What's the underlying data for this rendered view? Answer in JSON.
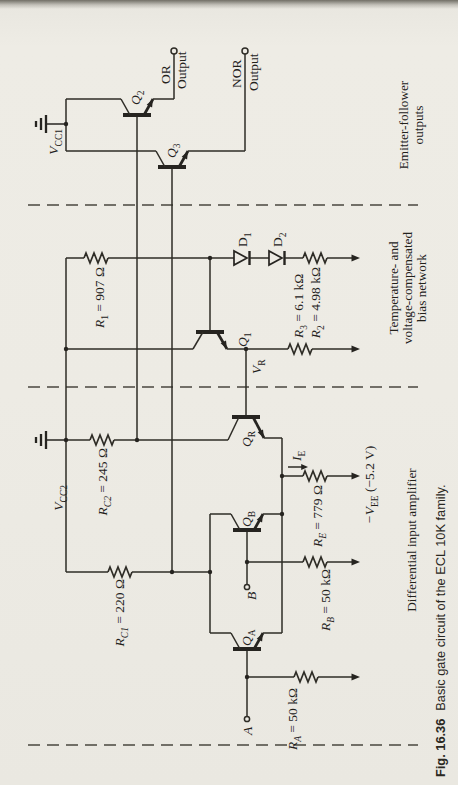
{
  "figure": {
    "caption_fig": "Fig. 16.36",
    "caption_text": "Basic gate circuit of the ECL 10K family.",
    "sections": {
      "emitter_follower": [
        "Emitter-follower",
        "outputs"
      ],
      "bias_network": [
        "Temperature- and",
        "voltage-compensated",
        "bias network"
      ],
      "diff_amp": [
        "Differential input amplifier"
      ]
    },
    "outputs": {
      "or": [
        "OR",
        "Output"
      ],
      "nor": [
        "NOR",
        "Output"
      ]
    },
    "inputs": {
      "a": "A",
      "b": "B"
    },
    "labels": {
      "vcc1": {
        "base": "V",
        "sub": "CC1"
      },
      "vcc2": {
        "base": "V",
        "sub": "CC2"
      },
      "vr": {
        "base": "V",
        "sub": "R"
      },
      "ie": {
        "base": "I",
        "sub": "E"
      },
      "vee": {
        "base": "−V",
        "sub": "EE",
        "val": " (−5.2 V)"
      },
      "r1": {
        "base": "R",
        "sub": "1",
        "val": " = 907 Ω"
      },
      "r2": {
        "base": "R",
        "sub": "2",
        "val": " = 4.98 kΩ"
      },
      "r3": {
        "base": "R",
        "sub": "3",
        "val": " = 6.1 kΩ"
      },
      "rc1": {
        "base": "R",
        "sub": "C1",
        "val": " = 220 Ω"
      },
      "rc2": {
        "base": "R",
        "sub": "C2",
        "val": " = 245 Ω"
      },
      "re": {
        "base": "R",
        "sub": "E",
        "val": " = 779 Ω"
      },
      "ra": {
        "base": "R",
        "sub": "A",
        "val": " = 50 kΩ"
      },
      "rb": {
        "base": "R",
        "sub": "B",
        "val": " = 50 kΩ"
      },
      "q1": {
        "base": "Q",
        "sub": "1"
      },
      "q2": {
        "base": "Q",
        "sub": "2"
      },
      "q3": {
        "base": "Q",
        "sub": "3"
      },
      "qa": {
        "base": "Q",
        "sub": "A"
      },
      "qb": {
        "base": "Q",
        "sub": "B"
      },
      "qr": {
        "base": "Q",
        "sub": "R"
      },
      "d1": {
        "base": "D",
        "sub": "1"
      },
      "d2": {
        "base": "D",
        "sub": "2"
      }
    },
    "colors": {
      "ink": "#2e2c26",
      "paper": "#edebe4"
    }
  }
}
